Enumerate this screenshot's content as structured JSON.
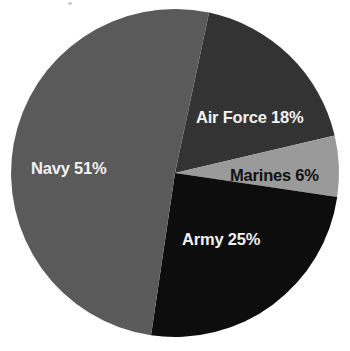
{
  "chart_data": {
    "type": "pie",
    "title": "",
    "subtitle": "",
    "xlabel": "",
    "ylabel": "",
    "legend_position": "none",
    "grid": false,
    "labels_inside_slices": true,
    "categories": [
      "Air Force",
      "Marines",
      "Army",
      "Navy"
    ],
    "values": [
      18,
      6,
      25,
      51
    ],
    "units": "percent",
    "total": 100,
    "slices": [
      {
        "name": "Air Force",
        "value": 18,
        "label": "Air Force 18%",
        "color": "#333333",
        "label_color": "#f2f2f2",
        "start_angle": 12,
        "end_angle": 76.8
      },
      {
        "name": "Marines",
        "value": 6,
        "label": "Marines 6%",
        "color": "#9a9a9a",
        "label_color": "#111111",
        "start_angle": 76.8,
        "end_angle": 98.4
      },
      {
        "name": "Army",
        "value": 25,
        "label": "Army 25%",
        "color": "#0d0d0d",
        "label_color": "#f2f2f2",
        "start_angle": 98.4,
        "end_angle": 188.4
      },
      {
        "name": "Navy",
        "value": 51,
        "label": "Navy 51%",
        "color": "#5a5a5a",
        "label_color": "#f2f2f2",
        "start_angle": 188.4,
        "end_angle": 372
      }
    ],
    "geometry": {
      "center_x": 175,
      "center_y": 173,
      "radius": 164
    },
    "background_color": "#ffffff"
  },
  "labels": {
    "navy": "Navy 51%",
    "air_force": "Air Force 18%",
    "marines": "Marines 6%",
    "army": "Army 25%"
  }
}
